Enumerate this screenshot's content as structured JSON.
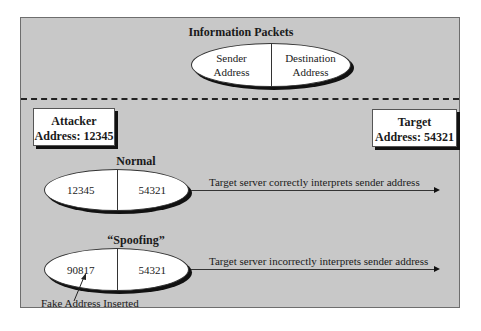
{
  "diagram": {
    "top_section": {
      "title": "Information Packets",
      "packet": {
        "left_label": "Sender\nAddress",
        "left_line1": "Sender",
        "left_line2": "Address",
        "right_line1": "Destination",
        "right_line2": "Address"
      }
    },
    "attacker": {
      "line1": "Attacker",
      "line2": "Address: 12345"
    },
    "target": {
      "line1": "Target",
      "line2": "Address: 54321"
    },
    "normal": {
      "title": "Normal",
      "sender": "12345",
      "destination": "54321",
      "arrow_label": "Target server correctly interprets sender address"
    },
    "spoofing": {
      "title": "“Spoofing”",
      "sender": "90817",
      "destination": "54321",
      "arrow_label": "Target server incorrectly interprets sender address",
      "annotation": "Fake Address Inserted"
    },
    "colors": {
      "panel_background": "#c8c8c8",
      "shape_fill": "#ffffff",
      "shadow": "#111111"
    }
  }
}
